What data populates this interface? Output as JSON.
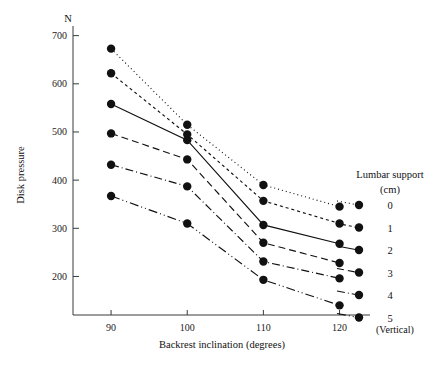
{
  "chart_data": {
    "type": "line",
    "title": "",
    "xlabel": "Backrest inclination (degrees)",
    "ylabel": "Disk pressure",
    "yunit": "N",
    "x_note": "(Vertical)",
    "categories": [
      "90",
      "100",
      "110",
      "120"
    ],
    "x": [
      90,
      100,
      110,
      120
    ],
    "xlim": [
      85,
      124
    ],
    "ylim": [
      120,
      720
    ],
    "yticks": [
      "200",
      "300",
      "400",
      "500",
      "600",
      "700"
    ],
    "ytick_values": [
      200,
      300,
      400,
      500,
      600,
      700
    ],
    "grid": false,
    "legend_position": "right",
    "legend_title_line1": "Lumbar support",
    "legend_title_line2": "(cm)",
    "series": [
      {
        "name": "0",
        "values": [
          673,
          515,
          390,
          345
        ],
        "dash": "1,3"
      },
      {
        "name": "1",
        "values": [
          622,
          495,
          357,
          310
        ],
        "dash": "3,3"
      },
      {
        "name": "2",
        "values": [
          558,
          483,
          307,
          268
        ],
        "dash": "none"
      },
      {
        "name": "3",
        "values": [
          497,
          443,
          270,
          228
        ],
        "dash": "7,4"
      },
      {
        "name": "4",
        "values": [
          432,
          387,
          231,
          196
        ],
        "dash": "8,3,1,3"
      },
      {
        "name": "5",
        "values": [
          367,
          310,
          193,
          140
        ],
        "dash": "9,3,1,3,1,3"
      }
    ]
  },
  "legend_entries": [
    {
      "label": "0"
    },
    {
      "label": "1"
    },
    {
      "label": "2"
    },
    {
      "label": "3"
    },
    {
      "label": "4"
    },
    {
      "label": "5"
    }
  ]
}
